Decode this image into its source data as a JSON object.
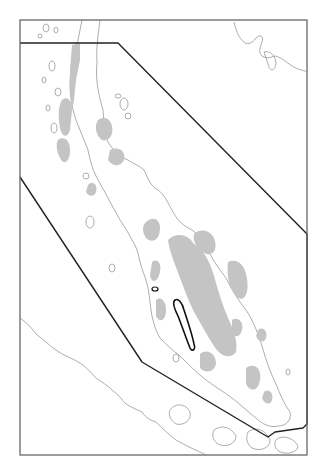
{
  "map": {
    "frame": {
      "x": 20,
      "y": 20,
      "width": 287,
      "height": 435
    },
    "study_area_polygon": [
      [
        20,
        43
      ],
      [
        118,
        43
      ],
      [
        307,
        234
      ],
      [
        307,
        424
      ],
      [
        303,
        428
      ],
      [
        275,
        432
      ],
      [
        268,
        437
      ],
      [
        142,
        362
      ],
      [
        20,
        177
      ]
    ],
    "highlighted_outline": "elongated-ridge-outline",
    "colors": {
      "background": "#ffffff",
      "highland_fill": "#c4c4c4",
      "coastline": "#8a8a8a",
      "polygon": "#222222",
      "frame": "#7a7a7a"
    },
    "legend": []
  }
}
